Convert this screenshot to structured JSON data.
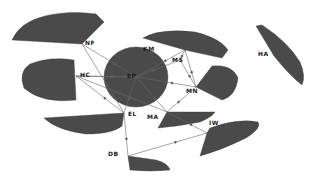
{
  "diagram": {
    "type": "network",
    "style": "grayscale hub-and-spoke clusters",
    "colors": {
      "edge": "#555555",
      "fan": "#4a4a4a",
      "label": "#1a1a1a",
      "background": "#ffffff"
    },
    "hubs": [
      {
        "id": "NF",
        "label": "NF",
        "x": 82,
        "y": 44,
        "lx": 85,
        "ly": 40
      },
      {
        "id": "KM",
        "label": "KM",
        "x": 185,
        "y": 50,
        "lx": 143,
        "ly": 46
      },
      {
        "id": "MS",
        "label": "MS",
        "x": 180,
        "y": 60,
        "lx": 172,
        "ly": 57
      },
      {
        "id": "MN",
        "label": "MN",
        "x": 196,
        "y": 87,
        "lx": 186,
        "ly": 88
      },
      {
        "id": "HA",
        "label": "HA",
        "x": 278,
        "y": 55,
        "lx": 258,
        "ly": 51
      },
      {
        "id": "HC",
        "label": "HC",
        "x": 76,
        "y": 76,
        "lx": 80,
        "ly": 72
      },
      {
        "id": "EP",
        "label": "EP",
        "x": 136,
        "y": 77,
        "lx": 127,
        "ly": 73
      },
      {
        "id": "EL",
        "label": "EL",
        "x": 124,
        "y": 113,
        "lx": 128,
        "ly": 111
      },
      {
        "id": "MA",
        "label": "MA",
        "x": 167,
        "y": 112,
        "lx": 147,
        "ly": 114
      },
      {
        "id": "IW",
        "label": "IW",
        "x": 207,
        "y": 133,
        "lx": 209,
        "ly": 120
      },
      {
        "id": "DB",
        "label": "DB",
        "x": 128,
        "y": 156,
        "lx": 108,
        "ly": 151
      }
    ],
    "edges": [
      [
        "NF",
        "EP"
      ],
      [
        "NF",
        "EL"
      ],
      [
        "HC",
        "EP"
      ],
      [
        "HC",
        "EL"
      ],
      [
        "HC",
        "MA"
      ],
      [
        "EP",
        "EL"
      ],
      [
        "EP",
        "KM"
      ],
      [
        "EP",
        "MN"
      ],
      [
        "KM",
        "MN"
      ],
      [
        "MS",
        "MN"
      ],
      [
        "KM",
        "MS"
      ],
      [
        "EL",
        "DB"
      ],
      [
        "MA",
        "IW"
      ],
      [
        "DB",
        "IW"
      ],
      [
        "MN",
        "MA"
      ],
      [
        "EP",
        "MA"
      ],
      [
        "HC",
        "EP"
      ],
      [
        "MS",
        "EP"
      ]
    ]
  }
}
